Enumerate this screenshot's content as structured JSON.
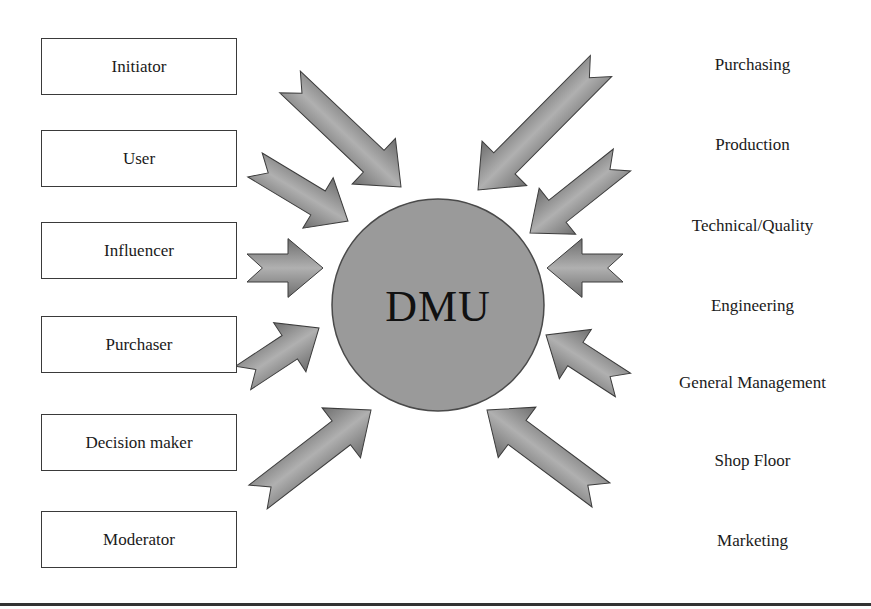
{
  "diagram": {
    "center": {
      "label": "DMU",
      "cx": 438,
      "cy": 305,
      "r": 106,
      "fill": "#9a9a9a",
      "stroke": "#4a4a4a"
    },
    "roles": [
      {
        "label": "Initiator",
        "top": 38
      },
      {
        "label": "User",
        "top": 130
      },
      {
        "label": "Influencer",
        "top": 222
      },
      {
        "label": "Purchaser",
        "top": 316
      },
      {
        "label": "Decision maker",
        "top": 414
      },
      {
        "label": "Moderator",
        "top": 511
      }
    ],
    "departments": [
      {
        "label": "Purchasing",
        "top": 55
      },
      {
        "label": "Production",
        "top": 135
      },
      {
        "label": "Technical/Quality",
        "top": 216
      },
      {
        "label": "Engineering",
        "top": 296
      },
      {
        "label": "General Management",
        "top": 373
      },
      {
        "label": "Shop Floor",
        "top": 451
      },
      {
        "label": "Marketing",
        "top": 531
      }
    ],
    "arrows": [
      {
        "name": "arrow-initiator",
        "tail": [
          290,
          82
        ],
        "tip": [
          401,
          187
        ],
        "w": 30
      },
      {
        "name": "arrow-user",
        "tail": [
          255,
          165
        ],
        "tip": [
          348,
          221
        ],
        "w": 28
      },
      {
        "name": "arrow-influencer",
        "tail": [
          247,
          268
        ],
        "tip": [
          323,
          268
        ],
        "w": 28
      },
      {
        "name": "arrow-purchaser",
        "tail": [
          243,
          378
        ],
        "tip": [
          319,
          328
        ],
        "w": 28
      },
      {
        "name": "arrow-decision-maker",
        "tail": [
          258,
          497
        ],
        "tip": [
          371,
          410
        ],
        "w": 30
      },
      {
        "name": "arrow-purchasing",
        "tail": [
          601,
          66
        ],
        "tip": [
          478,
          190
        ],
        "w": 30
      },
      {
        "name": "arrow-production",
        "tail": [
          622,
          160
        ],
        "tip": [
          530,
          233
        ],
        "w": 28
      },
      {
        "name": "arrow-technical",
        "tail": [
          623,
          268
        ],
        "tip": [
          547,
          268
        ],
        "w": 28
      },
      {
        "name": "arrow-general-management",
        "tail": [
          623,
          385
        ],
        "tip": [
          546,
          335
        ],
        "w": 28
      },
      {
        "name": "arrow-shop-floor",
        "tail": [
          601,
          495
        ],
        "tip": [
          487,
          410
        ],
        "w": 30
      }
    ],
    "colors": {
      "arrow_fill": "#8c8c8c",
      "arrow_stroke": "#3c3c3c",
      "box_border": "#3a3a3a",
      "rule": "#333333"
    }
  }
}
